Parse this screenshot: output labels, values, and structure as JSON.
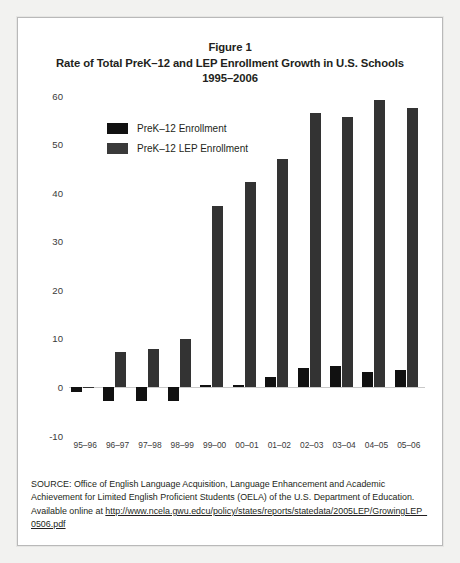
{
  "figure": {
    "title_lines": [
      "Figure 1",
      "Rate of Total PreK–12 and LEP Enrollment Growth in U.S. Schools",
      "1995–2006"
    ]
  },
  "legend": {
    "position": "inside-top-left",
    "items": [
      {
        "label": "PreK–12 Enrollment",
        "color": "#111111"
      },
      {
        "label": "PreK–12 LEP Enrollment",
        "color": "#3a3a3a"
      }
    ]
  },
  "source": {
    "text_before": "SOURCE: Office of English Language Acquisition, Language Enhancement and Academic Achievement for Limited English Proficient Students (OELA) of the U.S. Department of Education. Available online at ",
    "url": "http://www.ncela.gwu.edcu/policy/states/reports/statedata/2005LEP/GrowingLEP_0506.pdf"
  },
  "chart_data": {
    "type": "bar",
    "xlabel": "",
    "ylabel": "",
    "ylim": [
      -10,
      60
    ],
    "yticks": [
      -10,
      0,
      10,
      20,
      30,
      40,
      50,
      60
    ],
    "ytick_labels": [
      "-10",
      "0",
      "10",
      "20",
      "30",
      "40",
      "50",
      "60"
    ],
    "grid": false,
    "legend_position": "upper left",
    "categories": [
      "95–96",
      "96–97",
      "97–98",
      "98–99",
      "99–00",
      "00–01",
      "01–02",
      "02–03",
      "03–04",
      "04–05",
      "05–06"
    ],
    "series": [
      {
        "name": "PreK–12 Enrollment",
        "color": "#111111",
        "values": [
          -1.0,
          -3.0,
          -3.0,
          -3.0,
          0.5,
          0.3,
          2.0,
          4.0,
          4.4,
          3.0,
          3.5
        ]
      },
      {
        "name": "PreK–12 LEP Enrollment",
        "color": "#3a3a3a",
        "values": [
          0.0,
          7.2,
          7.8,
          9.8,
          37.2,
          42.2,
          47.0,
          56.3,
          55.5,
          59.0,
          57.5
        ]
      }
    ]
  }
}
